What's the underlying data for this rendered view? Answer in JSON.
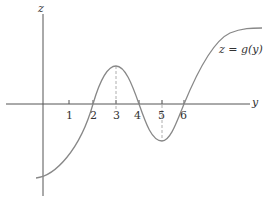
{
  "diagram": {
    "title": "",
    "axes": {
      "vertical_label": "z",
      "horizontal_label": "y"
    },
    "curve_label": "z = g(y)",
    "tick_labels": [
      "1",
      "2",
      "3",
      "4",
      "5",
      "6"
    ],
    "zeros": [
      "2",
      "4",
      "6"
    ],
    "local_max_at": "3",
    "local_min_at": "5",
    "colors": {
      "axis": "#555555",
      "curve": "#888888",
      "dashed": "#999999",
      "text": "#333333"
    }
  }
}
